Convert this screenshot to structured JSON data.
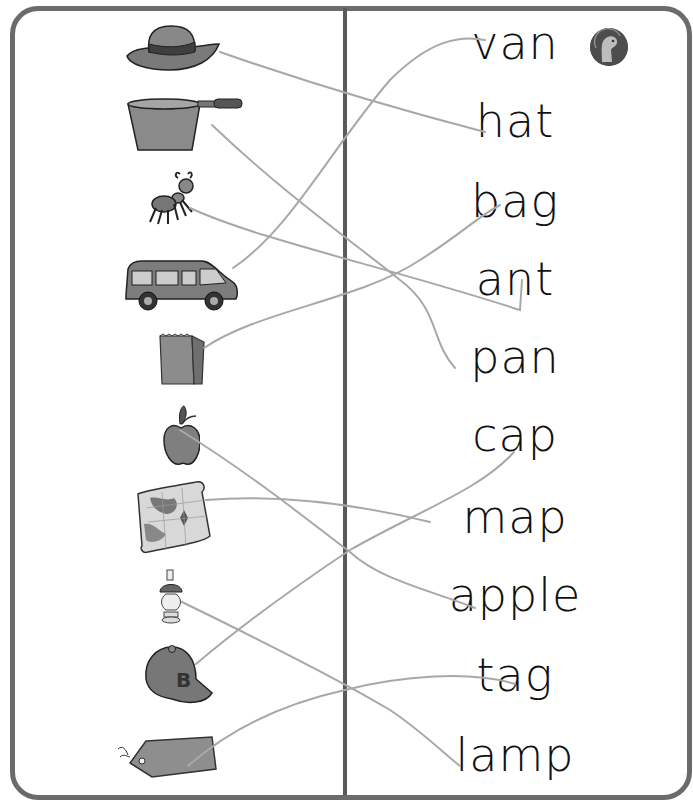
{
  "worksheet": {
    "pictures": [
      {
        "id": "hat",
        "label": "hat"
      },
      {
        "id": "pan",
        "label": "pan"
      },
      {
        "id": "ant",
        "label": "ant"
      },
      {
        "id": "van",
        "label": "van"
      },
      {
        "id": "bag",
        "label": "bag"
      },
      {
        "id": "apple",
        "label": "apple"
      },
      {
        "id": "map",
        "label": "map"
      },
      {
        "id": "lamp",
        "label": "lamp"
      },
      {
        "id": "cap",
        "label": "cap"
      },
      {
        "id": "tag",
        "label": "tag"
      }
    ],
    "words": [
      "van",
      "hat",
      "bag",
      "ant",
      "pan",
      "cap",
      "map",
      "apple",
      "tag",
      "lamp"
    ],
    "cap_letter": "B",
    "matches": [
      {
        "from": "hat",
        "to": "hat"
      },
      {
        "from": "pan",
        "to": "pan"
      },
      {
        "from": "ant",
        "to": "ant"
      },
      {
        "from": "van",
        "to": "van"
      },
      {
        "from": "bag",
        "to": "bag"
      },
      {
        "from": "apple",
        "to": "apple"
      },
      {
        "from": "map",
        "to": "map"
      },
      {
        "from": "lamp",
        "to": "lamp"
      },
      {
        "from": "cap",
        "to": "cap"
      },
      {
        "from": "tag",
        "to": "tag"
      }
    ],
    "badge_icon": "dinosaur-logo-icon",
    "colors": {
      "frame": "#6b6b6b",
      "divider": "#5a5a5a",
      "line": "#a8a8a8",
      "text": "#111111",
      "picture_fill": "#8a8a8a"
    }
  }
}
